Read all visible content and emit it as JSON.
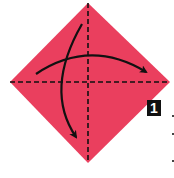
{
  "diagram": {
    "type": "origami-step",
    "step_number": "1",
    "paper_color": "#ea3f5e",
    "line_color": "#111111",
    "fold_lines": [
      {
        "name": "vertical-diagonal",
        "style": "dashed"
      },
      {
        "name": "horizontal-diagonal",
        "style": "dashed"
      }
    ],
    "arrows": [
      {
        "name": "fold-left-to-right",
        "direction": "left-to-right"
      },
      {
        "name": "fold-top-to-bottom",
        "direction": "top-to-bottom"
      }
    ]
  }
}
